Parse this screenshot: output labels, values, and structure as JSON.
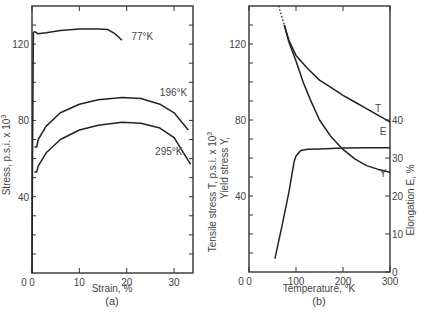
{
  "chart_data": [
    {
      "type": "line",
      "panel_label": "(a)",
      "title": "",
      "xlabel": "Strain, %",
      "ylabel": "Stress, p.s.i. x 10^3",
      "xlim": [
        0,
        34
      ],
      "ylim": [
        0,
        140
      ],
      "xticks": [
        0,
        10,
        20,
        30
      ],
      "yticks": [
        40,
        80,
        120
      ],
      "y_origin_label": "",
      "grid": false,
      "legend": "inline labels",
      "series": [
        {
          "name": "77°K",
          "label_pos": [
            21,
            122
          ],
          "x": [
            0,
            0.1,
            0.3,
            0.6,
            1.2,
            3,
            6,
            10,
            14,
            16,
            17.5,
            19
          ],
          "y": [
            0,
            60,
            126,
            126.5,
            125.5,
            126,
            127.2,
            128,
            128,
            127.6,
            125.5,
            122
          ]
        },
        {
          "name": "196°K",
          "label_pos": [
            27,
            93
          ],
          "x": [
            0.5,
            1,
            1.3,
            3,
            6,
            10,
            14,
            19,
            23,
            27,
            30,
            33
          ],
          "y": [
            66,
            66,
            70,
            77,
            84,
            88.5,
            90.8,
            92,
            91.5,
            88.5,
            84,
            75
          ]
        },
        {
          "name": "295°K",
          "label_pos": [
            26,
            62
          ],
          "x": [
            0.5,
            1,
            1.3,
            3,
            6,
            10,
            14,
            19,
            23,
            27,
            30,
            33.5
          ],
          "y": [
            53,
            53,
            56,
            63,
            70,
            75,
            77.5,
            79,
            78.5,
            76,
            71,
            57
          ]
        }
      ]
    },
    {
      "type": "line",
      "panel_label": "(b)",
      "title": "",
      "xlabel": "Temperature, °K",
      "ylabel_left": [
        "Tensile stress  T,    p.s.i. x 10^3",
        "Yield stress  Y,"
      ],
      "ylabel_right": "Elongation E, %",
      "xlim": [
        0,
        300
      ],
      "ylim_left": [
        0,
        140
      ],
      "ylim_right": [
        0,
        70
      ],
      "xticks": [
        0,
        100,
        200,
        300
      ],
      "yticks_left": [
        40,
        80,
        120
      ],
      "yticks_right": [
        0,
        10,
        20,
        30,
        40
      ],
      "grid": false,
      "series": [
        {
          "name": "T",
          "axis": "left",
          "label_pos": [
            268,
            84
          ],
          "dotted_x": [
            63,
            75
          ],
          "dotted_y": [
            140,
            130
          ],
          "x": [
            75,
            85,
            100,
            125,
            150,
            175,
            200,
            225,
            250,
            275,
            300
          ],
          "y": [
            130,
            122,
            114,
            107,
            101,
            97,
            93,
            89.5,
            86,
            82.5,
            79
          ]
        },
        {
          "name": "Y",
          "axis": "left",
          "label_pos": [
            278,
            50
          ],
          "x": [
            75,
            85,
            100,
            115,
            130,
            150,
            175,
            200,
            225,
            250,
            275,
            300
          ],
          "y": [
            130,
            121,
            111,
            100,
            91,
            80,
            71,
            64.5,
            59.5,
            56,
            54,
            52.5
          ]
        },
        {
          "name": "E",
          "axis": "right",
          "label_pos": [
            278,
            36
          ],
          "x": [
            55,
            70,
            85,
            96,
            100,
            110,
            125,
            150,
            200,
            250,
            300
          ],
          "y": [
            3.5,
            12,
            21,
            29,
            30.5,
            32,
            32.3,
            32.4,
            32.6,
            32.7,
            32.7
          ]
        }
      ]
    }
  ],
  "labels": {
    "panel_a": "(a)",
    "panel_b": "(b)",
    "xlabel_a": "Strain, %",
    "xlabel_b": "Temperature, °K",
    "ylabel_a": "Stress, p.s.i. x 10",
    "ylabel_b1": "Tensile stress  T,   p.s.i. x 10",
    "ylabel_b2": "Yield stress  Y,",
    "ylabel_b_right": "Elongation E, %"
  }
}
